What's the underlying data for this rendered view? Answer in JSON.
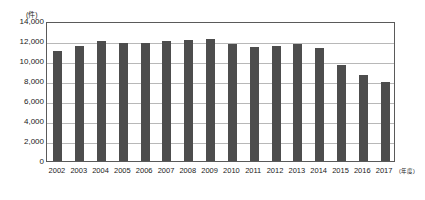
{
  "chart_data": {
    "type": "bar",
    "title": "",
    "subtitle": "",
    "xlabel": "年度",
    "ylabel": "件",
    "unit_label": "(件)",
    "x_axis_unit_label": "(年度)",
    "categories": [
      "2002",
      "2003",
      "2004",
      "2005",
      "2006",
      "2007",
      "2008",
      "2009",
      "2010",
      "2011",
      "2012",
      "2013",
      "2014",
      "2015",
      "2016",
      "2017"
    ],
    "values": [
      11000,
      11500,
      12000,
      11800,
      11850,
      12000,
      12150,
      12200,
      11750,
      11400,
      11500,
      11700,
      11300,
      9650,
      8600,
      7950
    ],
    "ylim": [
      0,
      14000
    ],
    "ytick_values": [
      0,
      2000,
      4000,
      6000,
      8000,
      10000,
      12000,
      14000
    ],
    "ytick_labels": [
      "0",
      "2,000",
      "4,000",
      "6,000",
      "8,000",
      "10,000",
      "12,000",
      "14,000"
    ],
    "grid": true,
    "grid_axis": "y",
    "legend": false,
    "legend_position": "none",
    "bar_color": "#4d4d4d",
    "gridline_color": "#b8b8b8",
    "axis_color": "#5a5a5a",
    "background_color": "#ffffff"
  }
}
